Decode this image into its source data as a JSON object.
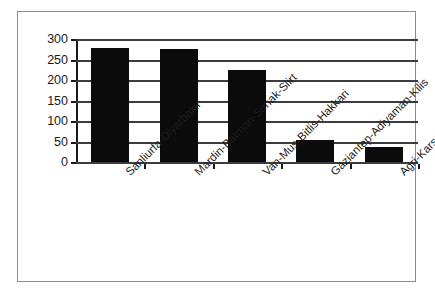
{
  "chart_data": {
    "type": "bar",
    "title": "",
    "subtitle": "",
    "xlabel": "",
    "ylabel": "",
    "categories": [
      "Sanliurfa-Diyarbakir",
      "Mardin-Batman-Sirnak-Siirt",
      "Van-Mus-Bitlis-Hakkari",
      "Gaziantep-Adiyaman-Kilis",
      "Agri-Kars-Igdir-Ardahan"
    ],
    "values": [
      278,
      275,
      225,
      54,
      36
    ],
    "ylim": [
      0,
      300
    ],
    "yticks": [
      0,
      50,
      100,
      150,
      200,
      250,
      300
    ],
    "ytick_labels": [
      "0",
      "50",
      "100",
      "150",
      "200",
      "250",
      "300"
    ],
    "grid": true,
    "grid_axis": "y",
    "legend": false,
    "legend_position": "none",
    "bar_color": "#0b0b0b",
    "axis_color": "#1a1a1a",
    "grid_color": "#3c3c3c",
    "frame_color": "#8d8d8d",
    "background": "#ffffff"
  }
}
